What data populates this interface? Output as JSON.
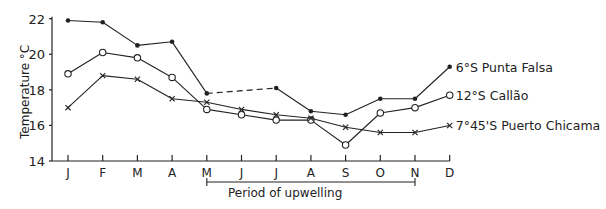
{
  "chart_data": {
    "type": "line",
    "title": "",
    "xlabel": "",
    "ylabel": "Temperature °C",
    "ylim": [
      14,
      22
    ],
    "yticks": [
      14,
      16,
      18,
      20,
      22
    ],
    "grid": false,
    "categories": [
      "J",
      "F",
      "M",
      "A",
      "M",
      "J",
      "J",
      "A",
      "S",
      "O",
      "N",
      "D"
    ],
    "series": [
      {
        "name": "6°S Punta Falsa",
        "marker": "filled-dot",
        "values": [
          21.9,
          21.8,
          20.5,
          20.7,
          17.8,
          null,
          18.1,
          16.8,
          16.6,
          17.5,
          17.5,
          19.3
        ],
        "note": "dashed segment between M and J (June missing)"
      },
      {
        "name": "12°S Callão",
        "marker": "open-circle",
        "values": [
          18.9,
          20.1,
          19.8,
          18.7,
          16.9,
          16.6,
          16.3,
          16.3,
          14.9,
          16.7,
          17.0,
          17.7
        ]
      },
      {
        "name": "7°45'S Puerto Chicama",
        "marker": "x",
        "values": [
          17.0,
          18.8,
          18.6,
          17.5,
          17.3,
          16.9,
          16.6,
          16.4,
          15.9,
          15.6,
          15.6,
          16.0
        ]
      }
    ],
    "annotations": [
      {
        "text": "Period of upwelling",
        "from": "M",
        "to": "N"
      }
    ],
    "legend_position": "inline-right"
  }
}
